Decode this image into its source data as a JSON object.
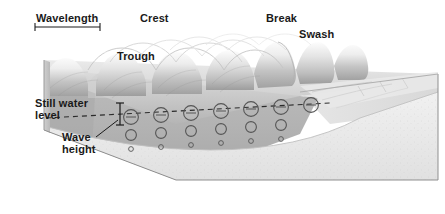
{
  "figure": {
    "width": 445,
    "height": 214,
    "background_color": "#ffffff"
  },
  "labels": {
    "wavelength": "Wavelength",
    "crest": "Crest",
    "trough": "Trough",
    "break": "Break",
    "swash": "Swash",
    "still_water_level": "Still water\nlevel",
    "wave_height": "Wave\nheight"
  },
  "colors": {
    "label_text": "#1a1a1a",
    "water_surface_light": "#f2f2f2",
    "water_surface_mid": "#c9c9c9",
    "water_surface_dark": "#9a9a9a",
    "water_body": "#b4b4b4",
    "water_body_shadow": "#a0a0a0",
    "seafloor_sand": "#ebebeb",
    "seafloor_sand_dark": "#dcdcdc",
    "block_side": "#c0c0c0",
    "block_outline": "#8c8c8c",
    "annotation_line": "#1a1a1a",
    "orbit_circle": "#5a5a5a",
    "dashed_line": "#333333"
  },
  "annotations": {
    "wavelength_bracket": {
      "name": "wavelength-measure-bracket",
      "x1": 35,
      "x2": 100,
      "y": 27,
      "tick_height": 7
    },
    "still_water_dashed_line": {
      "name": "still-water-level-dashed-line",
      "from_x": 46,
      "to_x": 300,
      "y_left": 118,
      "y_right": 104,
      "dash": "5 4"
    },
    "wave_height_bar": {
      "name": "wave-height-measure-bar",
      "x": 120,
      "y_top": 103,
      "y_bottom": 125,
      "cap_width": 9
    },
    "wave_height_leader": {
      "name": "wave-height-leader-line",
      "x1": 96,
      "y1": 136,
      "x2": 117,
      "y2": 119
    }
  },
  "orbital_motion": {
    "description": "Rows of circular orbital paths shrinking with depth, with direction arrow ticks on the still-water row",
    "rows": [
      {
        "name": "orbit-row-surface",
        "radius": 7.5,
        "count": 7
      },
      {
        "name": "orbit-row-mid",
        "radius": 5.5,
        "count": 7
      },
      {
        "name": "orbit-row-deep",
        "radius": 2.4,
        "count": 7
      }
    ],
    "x_positions": [
      131,
      161,
      191,
      221,
      251,
      281,
      311
    ],
    "surface_row_y": [
      117,
      115,
      113,
      111,
      109,
      107,
      105
    ]
  },
  "waves": {
    "description": "Smooth sinusoidal swell offshore steepening into breakers near shore",
    "crest_count": 7,
    "smooth_crest_count": 4,
    "breaking_crest_count": 3
  },
  "block": {
    "name": "three-dimensional-block-diagram",
    "top_left": [
      44,
      60
    ],
    "top_right": [
      438,
      74
    ],
    "bottom_right": [
      438,
      180
    ],
    "bottom_left": [
      44,
      130
    ],
    "front_bottom": [
      176,
      180
    ]
  }
}
